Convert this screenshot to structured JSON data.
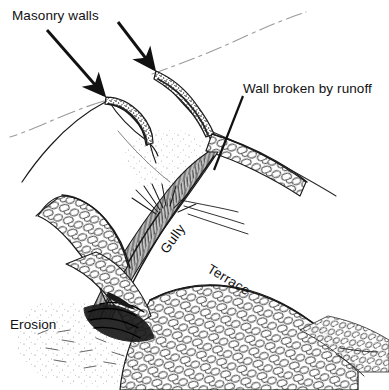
{
  "figure": {
    "kind": "line-drawing",
    "medium": "pen-and-ink technical illustration",
    "background_color": "#ffffff",
    "ink_color": "#1a1a1a",
    "faint_ink_color": "#8c8c8c",
    "width": 389,
    "height": 390
  },
  "labels": {
    "masonry_walls": "Masonry  walls",
    "wall_broken_by_runoff": "Wall broken by runoff",
    "gully": "Gully",
    "terrace": "Terrace",
    "erosion": "Erosion"
  },
  "annotations": {
    "arrow_left": {
      "name": "arrow-to-left-masonry-wall",
      "from": [
        47,
        30
      ],
      "to": [
        106,
        97
      ]
    },
    "arrow_right": {
      "name": "arrow-to-right-masonry-wall",
      "from": [
        118,
        22
      ],
      "to": [
        156,
        72
      ]
    },
    "leader_wall_broken": {
      "name": "leader-line-wall-broken-by-runoff",
      "from": [
        243,
        94
      ],
      "to": [
        214,
        168
      ]
    }
  },
  "scene_elements": [
    {
      "name": "masonry-wall-left",
      "description": "stippled stone check-dam wall crossing the left slope"
    },
    {
      "name": "masonry-wall-right",
      "description": "stippled stone check-dam wall crossing the right slope"
    },
    {
      "name": "gully-channel",
      "description": "deeply hatched eroded channel running down the centre"
    },
    {
      "name": "terrace-right",
      "description": "cobbled terrace face on the right bank"
    },
    {
      "name": "terrace-left",
      "description": "cobbled terrace face on the left bank"
    },
    {
      "name": "erosion-fan",
      "description": "stippled eroded debris fan at the base of the gully"
    },
    {
      "name": "contour-dashed-upper",
      "description": "faint dash-dot contour line across the upper slope"
    },
    {
      "name": "contour-dashed-lower",
      "description": "faint dash-dot contour line across the lower left slope"
    }
  ]
}
